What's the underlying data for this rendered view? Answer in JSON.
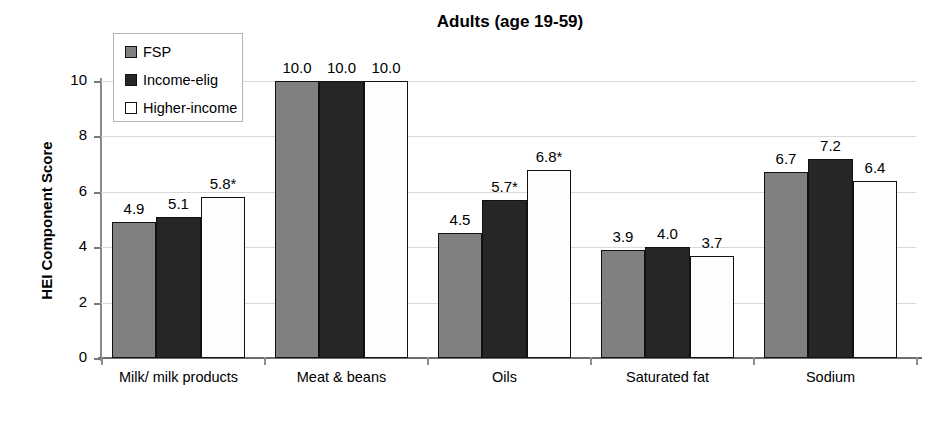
{
  "chart_data": {
    "type": "bar",
    "title": "Adults (age 19-59)",
    "xlabel": "",
    "ylabel": "HEI Component Score",
    "ylim": [
      0,
      11
    ],
    "yticks": [
      "0",
      "2",
      "4",
      "6",
      "8",
      "10"
    ],
    "ytick_values": [
      0,
      2,
      4,
      6,
      8,
      10
    ],
    "grid": true,
    "legend_position": "upper-left",
    "categories": [
      "Milk/ milk products",
      "Meat & beans",
      "Oils",
      "Saturated fat",
      "Sodium"
    ],
    "series": [
      {
        "name": "FSP",
        "color": "#808080",
        "values": [
          4.9,
          10.0,
          4.5,
          3.9,
          6.7
        ],
        "labels": [
          "4.9",
          "10.0",
          "4.5",
          "3.9",
          "6.7"
        ]
      },
      {
        "name": "Income-elig",
        "color": "#262626",
        "values": [
          5.1,
          10.0,
          5.7,
          4.0,
          7.2
        ],
        "labels": [
          "5.1",
          "10.0",
          "5.7*",
          "4.0",
          "7.2"
        ]
      },
      {
        "name": "Higher-income",
        "color": "#ffffff",
        "values": [
          5.8,
          10.0,
          6.8,
          3.7,
          6.4
        ],
        "labels": [
          "5.8*",
          "10.0",
          "6.8*",
          "3.7",
          "6.4"
        ]
      }
    ],
    "annotations": {
      "asterisk_note": "* marks significant difference"
    }
  },
  "legend": {
    "items": [
      {
        "label": "FSP",
        "swatch": "fsp"
      },
      {
        "label": "Income-elig",
        "swatch": "income"
      },
      {
        "label": "Higher-income",
        "swatch": "higher"
      }
    ]
  }
}
